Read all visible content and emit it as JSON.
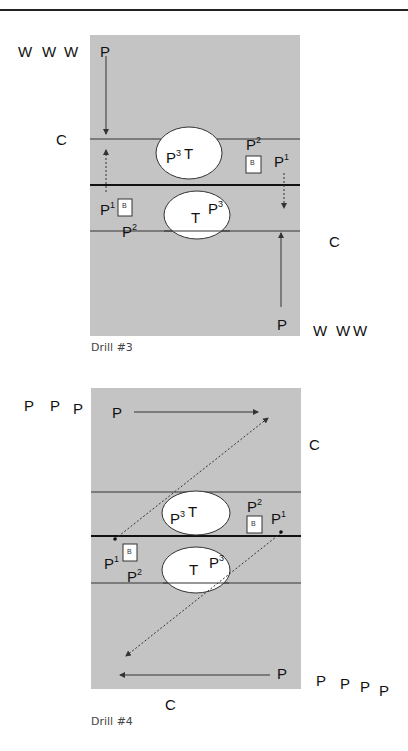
{
  "colors": {
    "court": "#c4c4c4",
    "line": "#333333",
    "ellipse": "#ffffff",
    "text": "#111111"
  },
  "drills": [
    {
      "caption": "Drill #3",
      "labels": {
        "w_top": [
          "W",
          "W",
          "W"
        ],
        "p_top": "P",
        "c_left": "C",
        "p2_top": "P",
        "p2_top_sup": "2",
        "p3_top": "P",
        "p3_top_sup": "3",
        "t_top": "T",
        "p1_right": "P",
        "p1_right_sup": "1",
        "b_right": "B",
        "p1_left": "P",
        "p1_left_sup": "1",
        "b_left": "B",
        "t_bottom": "T",
        "p3_bottom": "P",
        "p3_bottom_sup": "3",
        "p2_bottom": "P",
        "p2_bottom_sup": "2",
        "c_right": "C",
        "p_bottom": "P",
        "w_bottom": [
          "W",
          "W",
          "W"
        ]
      }
    },
    {
      "caption": "Drill #4",
      "labels": {
        "p_topleft": [
          "P",
          "P",
          "P"
        ],
        "p_top": "P",
        "c_right": "C",
        "p3_top": "P",
        "p3_top_sup": "3",
        "t_top": "T",
        "p2_top": "P",
        "p2_top_sup": "2",
        "b_right": "B",
        "p1_right": "P",
        "p1_right_sup": "1",
        "p1_left": "P",
        "p1_left_sup": "1",
        "b_left": "B",
        "p2_bottom": "P",
        "p2_bottom_sup": "2",
        "t_bottom": "T",
        "p3_bottom": "P",
        "p3_bottom_sup": "3",
        "p_bottom": "P",
        "p_bottomright": [
          "P",
          "P",
          "P",
          "P"
        ],
        "c_bottom": "C"
      }
    }
  ]
}
